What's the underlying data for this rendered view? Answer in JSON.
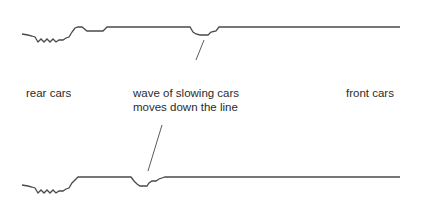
{
  "diagram": {
    "labels": {
      "rear": "rear cars",
      "wave_line1": "wave of slowing cars",
      "wave_line2": "moves down the line",
      "front": "front cars"
    },
    "top_line": {
      "description": "Line of cars at earlier time; slowdown dip near x≈203",
      "points": "22,34 28,35 32,36 35,37 38,42 41,39 44,42 47,39 50,42 53,39 56,42 59,40 63,40 66,38 69,37 72,32 75,28 78,27 82,27 87,31 103,31 107,27 190,27 193,32 196,34 200,35 208,35 211,32 216,31 219,27 400,27",
      "dip_center_x": 203
    },
    "bottom_line": {
      "description": "Line of cars at later time; slowdown dip moved back to x≈143",
      "points": "22,185 28,186 32,187 35,188 38,193 41,190 44,193 47,190 50,193 53,190 56,193 59,191 63,191 66,189 69,188 72,183 75,180 78,177 131,177 134,181 137,184 140,186 147,186 149,183 152,181 156,181 159,179 162,178 165,177 400,177",
      "dip_center_x": 143
    },
    "pointers": {
      "top": {
        "x1": 204,
        "y1": 40,
        "x2": 196,
        "y2": 60
      },
      "bottom": {
        "x1": 162,
        "y1": 125,
        "x2": 148,
        "y2": 171
      }
    },
    "colors": {
      "line": "#4a4a4a",
      "text": "#2b2b2b",
      "background": "#ffffff"
    }
  }
}
